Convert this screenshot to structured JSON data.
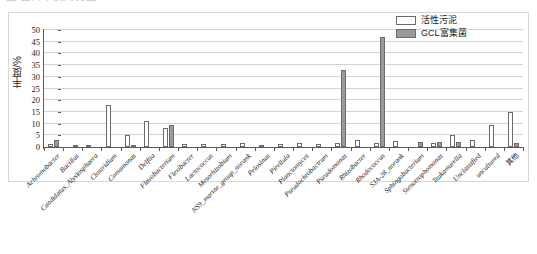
{
  "caption": {
    "cropped_text": "图 菌群丰度对比图"
  },
  "legend": {
    "position": "top-right",
    "items": [
      {
        "label": "活性污泥",
        "color": "#ffffff",
        "swatch": "white-swatch"
      },
      {
        "label": "GCL富集菌",
        "color": "#9a9a9a",
        "swatch": "gray-swatch"
      }
    ]
  },
  "axes": {
    "y_title": "丰度/%",
    "y_ticks": [
      "0",
      "5",
      "10",
      "15",
      "20",
      "25",
      "30",
      "35",
      "40",
      "45",
      "50"
    ]
  },
  "chart_data": {
    "type": "bar",
    "title": "",
    "xlabel": "",
    "ylabel": "丰度/%",
    "ylim": [
      0,
      50
    ],
    "ytick_step": 5,
    "grid": true,
    "legend_position": "top-right",
    "categories": [
      "Achromobacter",
      "Bacillus",
      "Candidatus_Alysiosphaera",
      "Clostridium",
      "Comamonas",
      "Delftia",
      "Flavobacterium",
      "Flexibacter",
      "Lactococcus",
      "Mesorhizobium",
      "NS9_marine_group_norank",
      "Pelosinus",
      "Pirellula",
      "Planctomyces",
      "Pseudochrobactrum",
      "Pseudomonas",
      "Rhizobacter",
      "Rhodococcus",
      "SJA-28_norank",
      "Sphingobacterium",
      "Stenotrophomonas",
      "Tsukamurella",
      "Unclassified",
      "uncultured",
      "其他"
    ],
    "series": [
      {
        "name": "活性污泥",
        "color": "#ffffff",
        "values": [
          1.2,
          0,
          1.0,
          18.0,
          5.0,
          11.0,
          8.0,
          1.5,
          1.2,
          1.5,
          1.6,
          1.0,
          1.5,
          1.6,
          1.5,
          1.6,
          2.8,
          1.8,
          2.6,
          0,
          1.8,
          5.0,
          3.2,
          9.2,
          15.0
        ]
      },
      {
        "name": "GCL富集菌",
        "color": "#9a9a9a",
        "values": [
          3.2,
          0.9,
          0,
          0,
          0.8,
          0,
          9.5,
          0,
          0,
          0,
          0,
          0,
          0,
          0,
          0,
          33.0,
          0,
          47.0,
          0,
          2.0,
          2.2,
          2.0,
          0,
          0,
          1.8
        ]
      }
    ]
  }
}
